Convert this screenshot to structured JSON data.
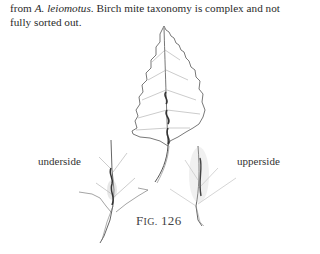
{
  "paragraph": {
    "prefix": "from ",
    "species": "A. leiomotus",
    "suffix": ". Birch mite taxonomy is complex and not fully sorted out."
  },
  "figure": {
    "illustration": "birch-leaf-with-mite-galls",
    "labels": {
      "underside": "underside",
      "upperside": "upperside"
    },
    "caption": {
      "first_letter": "F",
      "small_caps": "IG.",
      "number": "126"
    }
  }
}
